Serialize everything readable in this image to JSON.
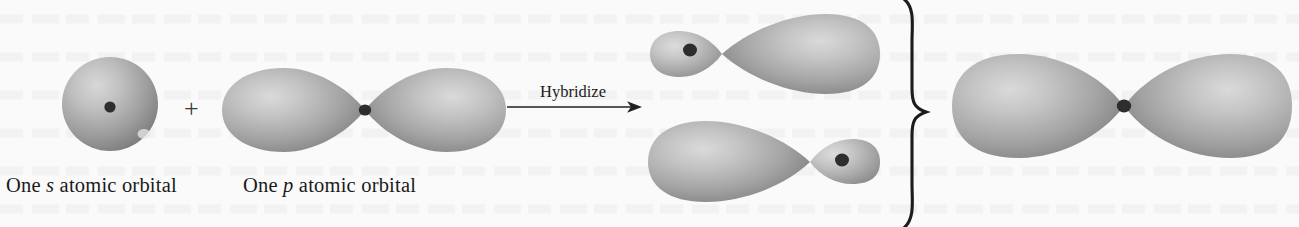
{
  "figure": {
    "type": "orbital-hybridization-diagram",
    "background_color": "#fafafa",
    "width": 1299,
    "height": 227
  },
  "reactants": {
    "s_orbital": {
      "label_prefix": "One ",
      "label_italic": "s",
      "label_suffix": " atomic orbital",
      "shape": "sphere",
      "nucleus_dot": "●"
    },
    "plus_sign": "+",
    "p_orbital": {
      "label_prefix": "One ",
      "label_italic": "p",
      "label_suffix": " atomic orbital",
      "shape": "two-equal-lobes",
      "nucleus_dot": "●"
    }
  },
  "transform": {
    "arrow_label": "Hybridize",
    "arrow_glyph": "→",
    "direction": "right"
  },
  "products": {
    "brace_glyph": "}",
    "hybrid_orbitals": [
      {
        "name": "sp-hybrid-orbital-top",
        "small_lobe_side": "left",
        "large_lobe_side": "right",
        "nucleus_dot": "●"
      },
      {
        "name": "sp-hybrid-orbital-bottom",
        "small_lobe_side": "right",
        "large_lobe_side": "left",
        "nucleus_dot": "●"
      }
    ],
    "combined_orbital": {
      "name": "combined-sp-orbital-set",
      "shape": "two-equal-lobes",
      "nucleus_dot": "●"
    }
  },
  "colors": {
    "lobe_highlight": "#d2d2d2",
    "lobe_mid": "#a8a8a8",
    "lobe_edge": "#7a7a7a",
    "nucleus": "#2e2e2e",
    "ink": "#1a1a1a"
  }
}
